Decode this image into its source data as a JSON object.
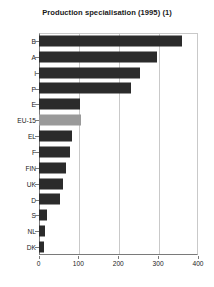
{
  "chart_data": {
    "type": "bar",
    "orientation": "horizontal",
    "title": "Production specialisation (1995) (1)",
    "xlabel": "",
    "ylabel": "",
    "xlim": [
      0,
      400
    ],
    "xticks": [
      0,
      100,
      200,
      300,
      400
    ],
    "grid": true,
    "legend": "none",
    "highlight_category": "EU-15",
    "colors": {
      "bar": "#2b2b2b",
      "highlight_bar": "#9a9a9a",
      "grid": "#c9c9c9",
      "axis": "#7a7a7a",
      "text": "#1a1a1a",
      "background": "#ffffff"
    },
    "categories": [
      "B",
      "A",
      "I",
      "P",
      "E",
      "EU-15",
      "EL",
      "F",
      "FIN",
      "UK",
      "D",
      "S",
      "NL",
      "DK"
    ],
    "values": [
      360,
      296,
      254,
      232,
      104,
      106,
      84,
      79,
      68,
      62,
      55,
      22,
      17,
      14
    ]
  }
}
